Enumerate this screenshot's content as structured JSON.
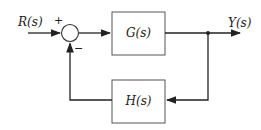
{
  "diagram": {
    "type": "feedback-control-block-diagram",
    "input_label": "R(s)",
    "output_label": "Y(s)",
    "forward_block": "G(s)",
    "feedback_block": "H(s)",
    "summing_junction": {
      "plus_sign": "+",
      "minus_sign": "−"
    },
    "colors": {
      "line": "#222222",
      "box_border": "#555555"
    }
  }
}
